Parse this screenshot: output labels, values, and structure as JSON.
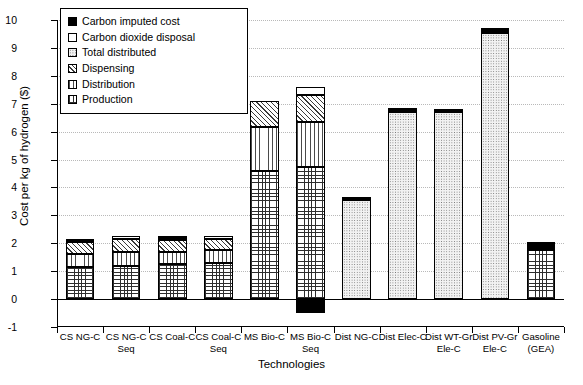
{
  "chart_data": {
    "type": "bar",
    "stacked": true,
    "title": "",
    "xlabel": "Technologies",
    "ylabel": "Cost per kg of hydrogen ($)",
    "ylim": [
      -1,
      10
    ],
    "yticks": [
      -1,
      0,
      1,
      2,
      3,
      4,
      5,
      6,
      7,
      8,
      9,
      10
    ],
    "grid": "horizontal-dotted",
    "legend_position": "top-left-inside",
    "categories": [
      "CS NG-C",
      "CS NG-C Seq",
      "CS Coal-C",
      "CS Coal-C Seq",
      "MS Bio-C",
      "MS Bio-C Seq",
      "Dist NG-C",
      "Dist Elec-C",
      "Dist WT-Gr Ele-C",
      "Dist PV-Gr Ele-C",
      "Gasoline (GEA)"
    ],
    "category_lines": [
      [
        "CS NG-C"
      ],
      [
        "CS NG-C",
        "Seq"
      ],
      [
        "CS Coal-C"
      ],
      [
        "CS Coal-C",
        "Seq"
      ],
      [
        "MS Bio-C"
      ],
      [
        "MS Bio-C",
        "Seq"
      ],
      [
        "Dist NG-C"
      ],
      [
        "Dist Elec-C"
      ],
      [
        "Dist WT-Gr",
        "Ele-C"
      ],
      [
        "Dist PV-Gr",
        "Ele-C"
      ],
      [
        "Gasoline",
        "(GEA)"
      ]
    ],
    "series": [
      {
        "name": "Production",
        "pattern": "grid",
        "values": [
          1.15,
          1.2,
          1.25,
          1.3,
          4.6,
          4.75,
          0.0,
          0.0,
          0.0,
          0.0,
          1.75
        ]
      },
      {
        "name": "Distribution",
        "pattern": "vert",
        "values": [
          0.45,
          0.5,
          0.45,
          0.45,
          1.55,
          1.6,
          0.0,
          0.0,
          0.0,
          0.0,
          0.0
        ]
      },
      {
        "name": "Dispensing",
        "pattern": "diag",
        "values": [
          0.45,
          0.45,
          0.4,
          0.4,
          0.95,
          0.95,
          0.0,
          0.0,
          0.0,
          0.0,
          0.0
        ]
      },
      {
        "name": "Total distributed",
        "pattern": "dots",
        "values": [
          0.0,
          0.0,
          0.0,
          0.0,
          0.0,
          0.0,
          3.55,
          6.7,
          6.7,
          9.55,
          0.0
        ]
      },
      {
        "name": "Carbon dioxide disposal",
        "pattern": "white",
        "values": [
          0.0,
          0.1,
          0.0,
          0.1,
          0.0,
          0.3,
          0.0,
          0.0,
          0.0,
          0.0,
          0.0
        ]
      },
      {
        "name": "Carbon imputed cost",
        "pattern": "black",
        "values": [
          0.12,
          0.0,
          0.15,
          0.0,
          0.0,
          -0.5,
          0.1,
          0.15,
          0.12,
          0.15,
          0.3
        ]
      }
    ],
    "bar_totals": [
      2.17,
      2.25,
      2.25,
      2.25,
      7.1,
      7.6,
      3.65,
      6.85,
      6.82,
      9.7,
      2.05
    ]
  },
  "legend": {
    "items": [
      {
        "label": "Carbon imputed cost",
        "swatch": "black"
      },
      {
        "label": "Carbon dioxide disposal",
        "swatch": "white"
      },
      {
        "label": "Total distributed",
        "swatch": "dots"
      },
      {
        "label": "Dispensing",
        "swatch": "diag"
      },
      {
        "label": "Distribution",
        "swatch": "vert"
      },
      {
        "label": "Production",
        "swatch": "grid"
      }
    ]
  },
  "axes": {
    "y_title": "Cost per kg of hydrogen ($)",
    "x_title": "Technologies",
    "y_tick_labels": [
      "10",
      "9",
      "8",
      "7",
      "6",
      "5",
      "4",
      "3",
      "2",
      "1",
      "0",
      "-1"
    ]
  }
}
